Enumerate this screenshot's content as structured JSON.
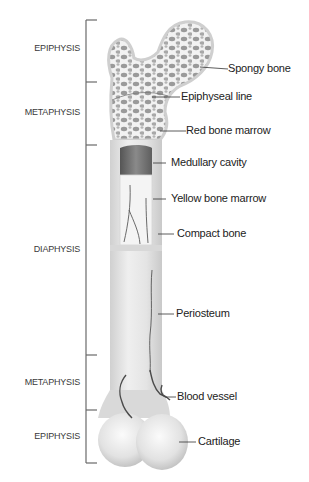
{
  "diagram": {
    "regions": [
      {
        "label": "EPIPHYSIS",
        "top": 20,
        "bottom": 82
      },
      {
        "label": "METAPHYSIS",
        "top": 82,
        "bottom": 145
      },
      {
        "label": "DIAPHYSIS",
        "top": 145,
        "bottom": 355
      },
      {
        "label": "METAPHYSIS",
        "top": 355,
        "bottom": 410
      },
      {
        "label": "EPIPHYSIS",
        "top": 410,
        "bottom": 463
      }
    ],
    "parts": [
      {
        "label": "Spongy bone"
      },
      {
        "label": "Epiphyseal line"
      },
      {
        "label": "Red bone marrow"
      },
      {
        "label": "Medullary cavity"
      },
      {
        "label": "Yellow bone marrow"
      },
      {
        "label": "Compact bone"
      },
      {
        "label": "Periosteum"
      },
      {
        "label": "Blood vessel"
      },
      {
        "label": "Cartilage"
      }
    ],
    "colors": {
      "bone_fill": "#e6e6e6",
      "bone_edge": "#c8c8c8",
      "cavity": "#6f6f6f",
      "vessel": "#555555",
      "bracket": "#6a6a6a"
    }
  }
}
